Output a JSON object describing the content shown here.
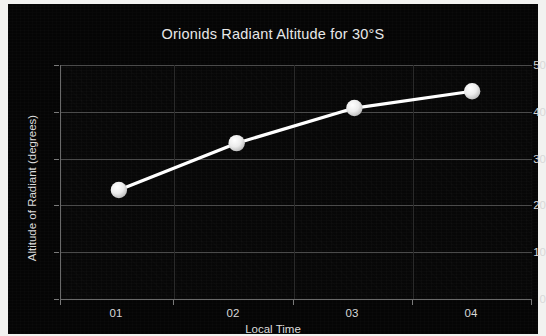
{
  "chart_data": {
    "type": "line",
    "title": "Orionids Radiant Altitude for 30°S",
    "xlabel": "Local Time",
    "ylabel": "Altitude of Radiant (degrees)",
    "categories": [
      "01",
      "02",
      "03",
      "04"
    ],
    "values": [
      23.3,
      33.3,
      40.8,
      44.4
    ],
    "series": [
      {
        "name": "Orionids radiant altitude",
        "values": [
          23.3,
          33.3,
          40.8,
          44.4
        ]
      }
    ],
    "ylim": [
      0,
      50
    ],
    "yticks": [
      0,
      10,
      20,
      30,
      40,
      50
    ],
    "xticks": [
      "01",
      "02",
      "03",
      "04"
    ],
    "grid": "horizontal",
    "legend": "none",
    "line_color": "#ffffff",
    "marker_color": "#f0f0f0",
    "background_color": "#050505",
    "text_color": "#e8e8e8",
    "gridline_color": "#4b4b4b"
  },
  "axes": {
    "y_tick_labels": [
      "50",
      "40",
      "30",
      "20",
      "10",
      "0"
    ],
    "x_tick_labels": [
      "01",
      "02",
      "03",
      "04"
    ]
  }
}
